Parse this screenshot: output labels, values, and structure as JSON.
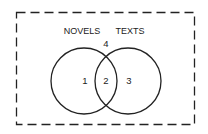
{
  "diagram": {
    "type": "venn",
    "universe_label": "",
    "sets": [
      {
        "name": "NOVELS",
        "label": "NOVELS"
      },
      {
        "name": "TEXTS",
        "label": "TEXTS"
      }
    ],
    "regions": [
      {
        "id": "1",
        "label": "1",
        "description": "NOVELS only"
      },
      {
        "id": "2",
        "label": "2",
        "description": "NOVELS and TEXTS"
      },
      {
        "id": "3",
        "label": "3",
        "description": "TEXTS only"
      },
      {
        "id": "4",
        "label": "4",
        "description": "neither"
      }
    ],
    "colors": {
      "stroke": "#222222",
      "background": "#ffffff"
    }
  }
}
